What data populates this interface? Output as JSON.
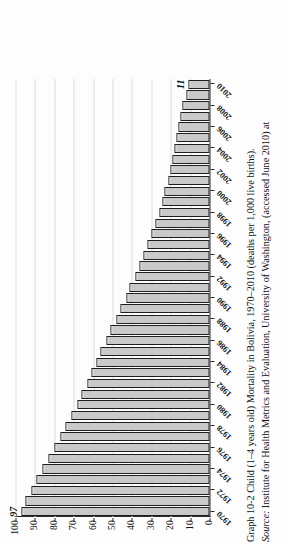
{
  "figure": {
    "caption_label": "Graph 10-2",
    "caption_text": "Child (1–4 years old) Mortality in Bolivia, 1970–2010 (deaths per 1,000 live births).",
    "source_label": "Source:",
    "source_text": "Institute for Health Metrics and Evaluation, University of Washington, (accessed June 2010) at"
  },
  "chart_data": {
    "type": "bar",
    "title": "Child (1–4 years old) Mortality in Bolivia, 1970–2010 (deaths per 1,000 live births)",
    "xlabel": "",
    "ylabel": "",
    "ylim": [
      0,
      100
    ],
    "grid": true,
    "legend": "none",
    "orientation": "vertical-bars-printed-sideways",
    "categories": [
      "1970",
      "1971",
      "1972",
      "1973",
      "1974",
      "1975",
      "1976",
      "1977",
      "1978",
      "1979",
      "1980",
      "1981",
      "1982",
      "1983",
      "1984",
      "1985",
      "1986",
      "1987",
      "1988",
      "1989",
      "1990",
      "1991",
      "1992",
      "1993",
      "1994",
      "1995",
      "1996",
      "1997",
      "1998",
      "1999",
      "2000",
      "2001",
      "2002",
      "2003",
      "2004",
      "2005",
      "2006",
      "2007",
      "2008",
      "2009",
      "2010"
    ],
    "values": [
      97,
      95,
      92,
      89,
      86,
      83,
      80,
      77,
      74,
      71,
      68,
      66,
      63,
      61,
      58,
      56,
      53,
      51,
      48,
      46,
      43,
      41,
      38,
      36,
      34,
      32,
      30,
      28,
      26,
      24,
      23,
      21,
      20,
      19,
      18,
      17,
      16,
      15,
      14,
      12,
      11
    ],
    "ytick_labels": [
      "100",
      "90",
      "80",
      "70",
      "60",
      "50",
      "40",
      "30",
      "20",
      "10",
      "0"
    ],
    "ytick_values": [
      100,
      90,
      80,
      70,
      60,
      50,
      40,
      30,
      20,
      10,
      0
    ],
    "xtick_labels": [
      "1970",
      "1972",
      "1974",
      "1976",
      "1978",
      "1980",
      "1982",
      "1984",
      "1986",
      "1988",
      "1990",
      "1992",
      "1994",
      "1996",
      "1998",
      "2000",
      "2002",
      "2004",
      "2006",
      "2008",
      "2010"
    ],
    "annotations": [
      {
        "category": "1970",
        "value": 97,
        "text": "97"
      },
      {
        "category": "2010",
        "value": 11,
        "text": "11"
      }
    ],
    "colors": {
      "bar_fill": "#c9c9c9",
      "bar_stroke": "#1e1e1e",
      "gridline": "#dcdcdc",
      "axis": "#2a2a2a",
      "text": "#141414",
      "background": "#fdfdfd"
    }
  }
}
